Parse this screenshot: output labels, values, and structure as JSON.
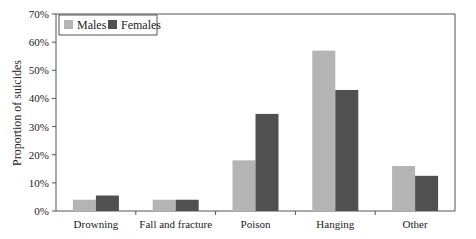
{
  "chart_data": {
    "type": "bar",
    "title": "",
    "xlabel": "",
    "ylabel": "Proportion of suicides",
    "categories": [
      "Drowning",
      "Fall and fracture",
      "Poison",
      "Hanging",
      "Other"
    ],
    "series": [
      {
        "name": "Males",
        "color": "#b4b4b4",
        "values": [
          4,
          4,
          18,
          57,
          16
        ]
      },
      {
        "name": "Females",
        "color": "#505050",
        "values": [
          5.5,
          4,
          34.5,
          43,
          12.5
        ]
      }
    ],
    "ylim": [
      0,
      70
    ],
    "yticks": [
      0,
      10,
      20,
      30,
      40,
      50,
      60,
      70
    ],
    "ytick_labels": [
      "0%",
      "10%",
      "20%",
      "30%",
      "40%",
      "50%",
      "60%",
      "70%"
    ],
    "grid": false,
    "legend_position": "top-left-inside"
  }
}
